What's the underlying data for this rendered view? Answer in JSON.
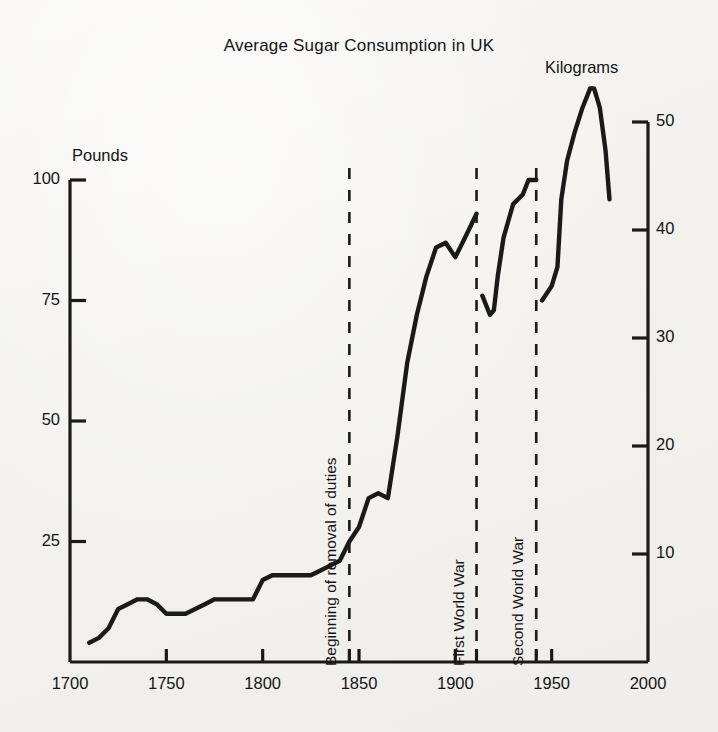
{
  "chart_data": {
    "type": "line",
    "title": "Average Sugar Consumption in UK",
    "xlabel": "",
    "ylabel": "Pounds",
    "ylabel_secondary": "Kilograms",
    "xlim": [
      1700,
      2000
    ],
    "ylim": [
      0,
      100
    ],
    "ylim_secondary": [
      0,
      55.5
    ],
    "grid": false,
    "legend": "none",
    "xticks": [
      1700,
      1750,
      1800,
      1850,
      1900,
      1950,
      2000
    ],
    "xticklabels": [
      "1700",
      "1750",
      "1800",
      "1850",
      "1900",
      "1950",
      "2000"
    ],
    "yticks": [
      25,
      50,
      75,
      100
    ],
    "yticklabels": [
      "25",
      "50",
      "75",
      "100"
    ],
    "yticks_secondary": [
      10,
      20,
      30,
      40,
      50
    ],
    "yticklabels_secondary": [
      "10",
      "20",
      "30",
      "40",
      "50"
    ],
    "units": {
      "left": "Pounds",
      "right": "Kilograms",
      "conversion": "1 kg = 2.2046 lb"
    },
    "series": [
      {
        "name": "Average sugar consumption per head",
        "unit": "pounds per year",
        "segment": "1710-1911",
        "x": [
          1710,
          1715,
          1720,
          1725,
          1730,
          1735,
          1740,
          1745,
          1750,
          1755,
          1760,
          1765,
          1770,
          1775,
          1780,
          1785,
          1790,
          1795,
          1800,
          1805,
          1810,
          1815,
          1820,
          1825,
          1830,
          1835,
          1840,
          1845,
          1850,
          1855,
          1860,
          1865,
          1870,
          1875,
          1880,
          1885,
          1890,
          1895,
          1900,
          1905,
          1911
        ],
        "values": [
          4,
          5,
          7,
          11,
          12,
          13,
          13,
          12,
          10,
          10,
          10,
          11,
          12,
          13,
          13,
          13,
          13,
          13,
          17,
          18,
          18,
          18,
          18,
          18,
          19,
          20,
          21,
          25,
          28,
          34,
          35,
          34,
          47,
          62,
          72,
          80,
          86,
          87,
          84,
          88,
          93
        ]
      },
      {
        "name": "Average sugar consumption per head",
        "unit": "pounds per year",
        "segment": "1914-1942",
        "x": [
          1914,
          1918,
          1920,
          1922,
          1925,
          1930,
          1935,
          1938,
          1942
        ],
        "values": [
          76,
          72,
          73,
          80,
          88,
          95,
          97,
          100,
          100
        ]
      },
      {
        "name": "Average sugar consumption per head",
        "unit": "pounds per year",
        "segment": "1945-1980",
        "x": [
          1945,
          1950,
          1953,
          1955,
          1958,
          1962,
          1966,
          1970,
          1972,
          1975,
          1978,
          1980
        ],
        "values": [
          75,
          78,
          82,
          96,
          104,
          110,
          115,
          119,
          119,
          115,
          106,
          96
        ]
      }
    ],
    "annotations": [
      {
        "label": "Beginning of removal of duties",
        "x": 1845,
        "style": "dashed-vertical"
      },
      {
        "label": "First World War",
        "x": 1911,
        "style": "dashed-vertical"
      },
      {
        "label": "Second World War",
        "x": 1942,
        "style": "dashed-vertical"
      }
    ]
  },
  "colors": {
    "line": "#1a1a1a",
    "axis": "#1a1a1a",
    "text": "#141414",
    "background": "#f3f2ef"
  }
}
